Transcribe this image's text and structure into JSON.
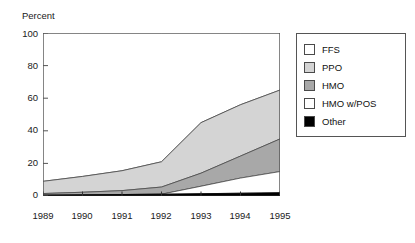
{
  "chart_data": {
    "type": "area",
    "title": "",
    "subtitle": "",
    "xlabel": "",
    "ylabel": "Percent",
    "stacked": true,
    "grid": false,
    "legend_position": "right",
    "categories": [
      "1989",
      "1990",
      "1991",
      "1992",
      "1993",
      "1994",
      "1995"
    ],
    "x": [
      1989,
      1990,
      1991,
      1992,
      1993,
      1994,
      1995
    ],
    "xlim": [
      1989,
      1995
    ],
    "ylim": [
      0,
      100
    ],
    "yticks": [
      0,
      20,
      40,
      60,
      80,
      100
    ],
    "xticks": [
      "1989",
      "1990",
      "1991",
      "1992",
      "1993",
      "1994",
      "1995"
    ],
    "series": [
      {
        "name": "Other",
        "color": "#000000",
        "values": [
          0.5,
          0.7,
          0.9,
          1.1,
          1.4,
          1.7,
          2.0
        ],
        "cumulative": [
          0.5,
          0.7,
          0.9,
          1.1,
          1.4,
          1.7,
          2.0
        ]
      },
      {
        "name": "HMO w/POS",
        "color": "#ffffff",
        "values": [
          0,
          0,
          0,
          0,
          4.6,
          9.3,
          13.0
        ],
        "cumulative": [
          0.5,
          0.7,
          0.9,
          1.1,
          6.0,
          11.0,
          15.0
        ]
      },
      {
        "name": "HMO",
        "color": "#a8a8a8",
        "values": [
          1.0,
          1.6,
          2.4,
          4.4,
          8.0,
          13.5,
          20.0
        ],
        "cumulative": [
          1.5,
          2.3,
          3.3,
          5.5,
          14.0,
          24.5,
          35.0
        ]
      },
      {
        "name": "PPO",
        "color": "#d4d4d4",
        "values": [
          7.5,
          9.7,
          12.2,
          15.5,
          31.0,
          31.5,
          30.0
        ],
        "cumulative": [
          9.0,
          12.0,
          15.5,
          21.0,
          45.0,
          56.0,
          65.0
        ]
      },
      {
        "name": "FFS",
        "color": "#ffffff",
        "values": [
          91.0,
          88.0,
          84.5,
          79.0,
          55.0,
          44.0,
          35.0
        ],
        "cumulative": [
          100,
          100,
          100,
          100,
          100,
          100,
          100
        ]
      }
    ],
    "legend_entries": [
      {
        "label": "FFS",
        "color": "#ffffff"
      },
      {
        "label": "PPO",
        "color": "#d4d4d4"
      },
      {
        "label": "HMO",
        "color": "#a8a8a8"
      },
      {
        "label": "HMO w/POS",
        "color": "#ffffff"
      },
      {
        "label": "Other",
        "color": "#000000"
      }
    ]
  },
  "axes": {
    "y_title": "Percent",
    "y_ticks": [
      "100",
      "80",
      "60",
      "40",
      "20",
      "0"
    ],
    "x_ticks": [
      "1989",
      "1990",
      "1991",
      "1992",
      "1993",
      "1994",
      "1995"
    ]
  },
  "legend": {
    "items": [
      {
        "label": "FFS"
      },
      {
        "label": "PPO"
      },
      {
        "label": "HMO"
      },
      {
        "label": "HMO w/POS"
      },
      {
        "label": "Other"
      }
    ]
  },
  "colors": {
    "axis": "#555555",
    "ppo_fill": "#d4d4d4",
    "hmo_fill": "#a8a8a8",
    "ffs_fill": "#ffffff",
    "hmopos_fill": "#ffffff",
    "other_fill": "#000000",
    "outline": "#4a4a4a"
  }
}
